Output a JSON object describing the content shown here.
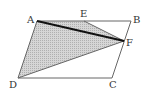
{
  "diagram": {
    "points": {
      "A": {
        "label": "A",
        "x": 37,
        "y": 21
      },
      "B": {
        "label": "B",
        "x": 131,
        "y": 21
      },
      "C": {
        "label": "C",
        "x": 112,
        "y": 78
      },
      "D": {
        "label": "D",
        "x": 18,
        "y": 78
      },
      "E": {
        "label": "E",
        "x": 84,
        "y": 21
      },
      "F": {
        "label": "F",
        "x": 124,
        "y": 41
      }
    },
    "shaded_region": [
      "A",
      "E",
      "F",
      "D"
    ],
    "bold_segment": [
      "A",
      "F"
    ],
    "colors": {
      "shade": "#c8c8c8",
      "line": "#555555",
      "bold": "#111111"
    }
  }
}
